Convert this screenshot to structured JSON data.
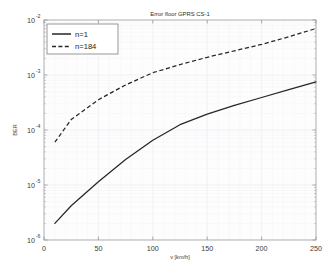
{
  "chart_data": {
    "type": "line",
    "title": "Error floor GPRS CS-1",
    "xlabel": "v [km/h]",
    "ylabel": "BER",
    "xscale": "linear",
    "yscale": "log",
    "xlim": [
      0,
      250
    ],
    "ylim": [
      1e-06,
      0.01
    ],
    "grid": true,
    "legend_position": "top-left",
    "xticks": [
      0,
      50,
      100,
      150,
      200,
      250
    ],
    "xtick_labels": [
      "0",
      "50",
      "100",
      "150",
      "200",
      "250"
    ],
    "yticks": [
      1e-06,
      1e-05,
      0.0001,
      0.001,
      0.01
    ],
    "ytick_labels": [
      "10",
      "10",
      "10",
      "10",
      "10"
    ],
    "ytick_exponents": [
      "-6",
      "-5",
      "-4",
      "-3",
      "-2"
    ],
    "series": [
      {
        "name": "n=1",
        "style": "solid",
        "color": "#262626",
        "x": [
          10,
          25,
          50,
          75,
          100,
          125,
          150,
          175,
          200,
          225,
          250
        ],
        "y": [
          2e-06,
          4.2e-06,
          1.15e-05,
          2.9e-05,
          6.5e-05,
          0.000125,
          0.000195,
          0.00028,
          0.00039,
          0.00054,
          0.00075
        ]
      },
      {
        "name": "n=184",
        "style": "dashed",
        "color": "#262626",
        "x": [
          10,
          25,
          50,
          75,
          100,
          125,
          150,
          175,
          200,
          225,
          250
        ],
        "y": [
          6e-05,
          0.000155,
          0.000355,
          0.00066,
          0.0011,
          0.00155,
          0.0021,
          0.00275,
          0.0036,
          0.00495,
          0.007
        ]
      }
    ]
  },
  "legend": {
    "entries": [
      {
        "label": "n=1",
        "style": "solid"
      },
      {
        "label": "n=184",
        "style": "dashed"
      }
    ]
  }
}
